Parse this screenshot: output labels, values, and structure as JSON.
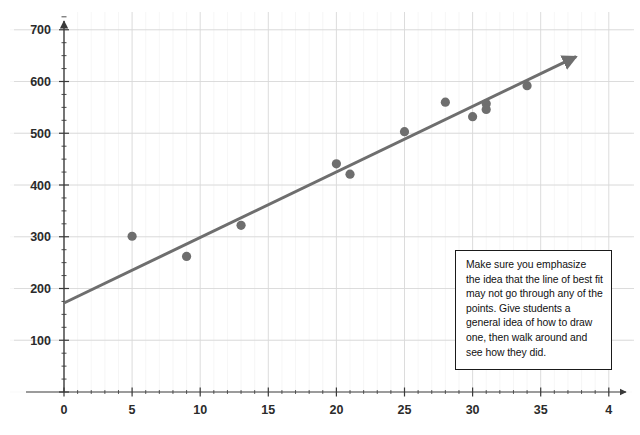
{
  "chart_data": {
    "type": "scatter",
    "title": "",
    "xlabel": "",
    "ylabel": "",
    "xlim": [
      0,
      40
    ],
    "ylim": [
      0,
      730
    ],
    "grid": true,
    "legend": null,
    "x_ticks": [
      0,
      5,
      10,
      15,
      20,
      25,
      30,
      35,
      40
    ],
    "x_tick_labels": [
      "0",
      "5",
      "10",
      "15",
      "20",
      "25",
      "30",
      "35",
      "4"
    ],
    "y_ticks": [
      100,
      200,
      300,
      400,
      500,
      600,
      700
    ],
    "y_tick_labels": [
      "100",
      "200",
      "300",
      "400",
      "500",
      "600",
      "700"
    ],
    "minor_tick_step_x": 1,
    "minor_tick_step_y": 25,
    "series": [
      {
        "name": "data points",
        "type": "scatter",
        "marker": "circle",
        "color": "#6e6e6e",
        "points": [
          {
            "x": 5,
            "y": 301
          },
          {
            "x": 9,
            "y": 262
          },
          {
            "x": 13,
            "y": 322
          },
          {
            "x": 20,
            "y": 441
          },
          {
            "x": 21,
            "y": 421
          },
          {
            "x": 25,
            "y": 503
          },
          {
            "x": 28,
            "y": 560
          },
          {
            "x": 30,
            "y": 532
          },
          {
            "x": 31,
            "y": 557
          },
          {
            "x": 31,
            "y": 546
          },
          {
            "x": 34,
            "y": 592
          }
        ]
      },
      {
        "name": "line of best fit",
        "type": "line",
        "color": "#6e6e6e",
        "arrow": true,
        "x_start": 0,
        "y_start": 172,
        "x_end": 37.6,
        "y_end": 648
      }
    ]
  },
  "annotation": {
    "note_text": "Make sure you emphasize the idea that the line of best fit may not go through any of the points.  Give students a general idea of how to draw one, then walk around and see how they did."
  },
  "colors": {
    "marker": "#6e6e6e",
    "line": "#6e6e6e",
    "axis": "#3a3a3a",
    "grid": "#d8d8d8",
    "grid_minor": "#ededed",
    "text": "#2b2b2b",
    "note_border": "#1a1a1a",
    "background": "#ffffff"
  }
}
